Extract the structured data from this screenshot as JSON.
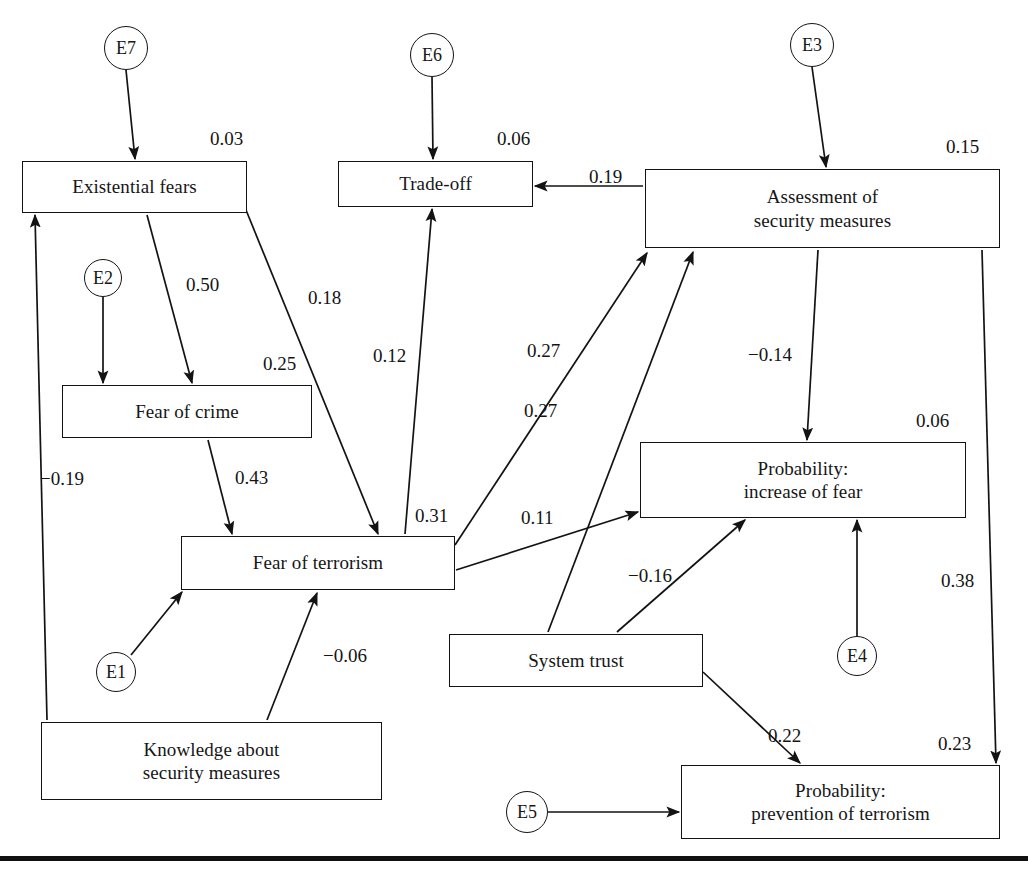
{
  "figure": {
    "type": "path-diagram",
    "title": ""
  },
  "nodes": [
    {
      "id": "existential-fears",
      "label": "Existential fears",
      "lines": [
        "Existential fears"
      ],
      "shape": "rect",
      "x": 22,
      "y": 161,
      "w": 225,
      "h": 52
    },
    {
      "id": "trade-off",
      "label": "Trade-off",
      "lines": [
        "Trade-off"
      ],
      "shape": "rect",
      "x": 338,
      "y": 161,
      "w": 195,
      "h": 46
    },
    {
      "id": "assessment-of-security-measures",
      "label": "Assessment of security measures",
      "lines": [
        "Assessment of",
        "security measures"
      ],
      "shape": "rect",
      "x": 645,
      "y": 169,
      "w": 355,
      "h": 79
    },
    {
      "id": "fear-of-crime",
      "label": "Fear of crime",
      "lines": [
        "Fear of crime"
      ],
      "shape": "rect",
      "x": 62,
      "y": 385,
      "w": 250,
      "h": 53
    },
    {
      "id": "probability-increase-of-fear",
      "label": "Probability: increase of fear",
      "lines": [
        "Probability:",
        "increase of fear"
      ],
      "shape": "rect",
      "x": 640,
      "y": 442,
      "w": 326,
      "h": 76
    },
    {
      "id": "fear-of-terrorism",
      "label": "Fear of terrorism",
      "lines": [
        "Fear of terrorism"
      ],
      "shape": "rect",
      "x": 181,
      "y": 536,
      "w": 274,
      "h": 54
    },
    {
      "id": "system-trust",
      "label": "System trust",
      "lines": [
        "System trust"
      ],
      "shape": "rect",
      "x": 449,
      "y": 634,
      "w": 254,
      "h": 53
    },
    {
      "id": "knowledge-about-security-measures",
      "label": "Knowledge about security measures",
      "lines": [
        "Knowledge about",
        "security measures"
      ],
      "shape": "rect",
      "x": 41,
      "y": 722,
      "w": 341,
      "h": 78
    },
    {
      "id": "probability-prevention-of-terrorism",
      "label": "Probability: prevention of terrorism",
      "lines": [
        "Probability:",
        "prevention of terrorism"
      ],
      "shape": "rect",
      "x": 681,
      "y": 765,
      "w": 319,
      "h": 74
    }
  ],
  "error_terms": [
    {
      "id": "E7",
      "label": "E7",
      "cx": 126,
      "cy": 48,
      "r": 22
    },
    {
      "id": "E6",
      "label": "E6",
      "cx": 432,
      "cy": 55,
      "r": 22
    },
    {
      "id": "E3",
      "label": "E3",
      "cx": 812,
      "cy": 45,
      "r": 22
    },
    {
      "id": "E2",
      "label": "E2",
      "cx": 103,
      "cy": 278,
      "r": 19
    },
    {
      "id": "E1",
      "label": "E1",
      "cx": 116,
      "cy": 672,
      "r": 20
    },
    {
      "id": "E4",
      "label": "E4",
      "cx": 857,
      "cy": 656,
      "r": 20
    },
    {
      "id": "E5",
      "label": "E5",
      "cx": 527,
      "cy": 812,
      "r": 21
    }
  ],
  "explained_variance": [
    {
      "node": "existential-fears",
      "value": "0.03",
      "x": 210,
      "y": 128
    },
    {
      "node": "trade-off",
      "value": "0.06",
      "x": 497,
      "y": 128
    },
    {
      "node": "assessment-of-security-measures",
      "value": "0.15",
      "x": 946,
      "y": 136
    },
    {
      "node": "fear-of-crime",
      "value": "0.25",
      "x": 263,
      "y": 353
    },
    {
      "node": "probability-increase-of-fear",
      "value": "0.06",
      "x": 916,
      "y": 410
    },
    {
      "node": "fear-of-terrorism",
      "value": "0.31",
      "x": 415,
      "y": 505
    },
    {
      "node": "probability-prevention-of-terrorism",
      "value": "0.23",
      "x": 938,
      "y": 733
    }
  ],
  "paths": [
    {
      "id": "e7-to-existential-fears",
      "from": "E7",
      "to": "existential-fears",
      "coefficient": "",
      "x1": 126,
      "y1": 70,
      "x2": 135,
      "y2": 159
    },
    {
      "id": "e6-to-trade-off",
      "from": "E6",
      "to": "trade-off",
      "coefficient": "",
      "x1": 432,
      "y1": 77,
      "x2": 433,
      "y2": 159
    },
    {
      "id": "e3-to-assessment",
      "from": "E3",
      "to": "assessment-of-security-measures",
      "coefficient": "",
      "x1": 812,
      "y1": 67,
      "x2": 826,
      "y2": 167
    },
    {
      "id": "e2-to-fear-of-crime",
      "from": "E2",
      "to": "fear-of-crime",
      "coefficient": "",
      "x1": 103,
      "y1": 297,
      "x2": 103,
      "y2": 383
    },
    {
      "id": "e1-to-fear-of-terrorism",
      "from": "E1",
      "to": "fear-of-terrorism",
      "coefficient": "",
      "x1": 131,
      "y1": 655,
      "x2": 182,
      "y2": 592
    },
    {
      "id": "e4-to-probability-increase",
      "from": "E4",
      "to": "probability-increase-of-fear",
      "coefficient": "",
      "x1": 857,
      "y1": 636,
      "x2": 857,
      "y2": 520
    },
    {
      "id": "e5-to-probability-prevention",
      "from": "E5",
      "to": "probability-prevention-of-terrorism",
      "coefficient": "",
      "x1": 548,
      "y1": 812,
      "x2": 679,
      "y2": 812
    },
    {
      "id": "existential-fears-to-fear-of-crime",
      "from": "existential-fears",
      "to": "fear-of-crime",
      "coefficient": "0.50",
      "label_x": 186,
      "label_y": 274,
      "x1": 147,
      "y1": 215,
      "x2": 192,
      "y2": 383
    },
    {
      "id": "existential-fears-to-fear-of-terrorism",
      "from": "existential-fears",
      "to": "fear-of-terrorism",
      "coefficient": "0.18",
      "label_x": 308,
      "label_y": 287,
      "x1": 246,
      "y1": 210,
      "x2": 378,
      "y2": 534
    },
    {
      "id": "fear-of-crime-to-fear-of-terrorism",
      "from": "fear-of-crime",
      "to": "fear-of-terrorism",
      "coefficient": "0.43",
      "label_x": 235,
      "label_y": 467,
      "x1": 208,
      "y1": 440,
      "x2": 232,
      "y2": 534
    },
    {
      "id": "knowledge-to-existential-fears",
      "from": "knowledge-about-security-measures",
      "to": "existential-fears",
      "coefficient": "−0.19",
      "label_x": 40,
      "label_y": 468,
      "x1": 47,
      "y1": 720,
      "x2": 35,
      "y2": 215
    },
    {
      "id": "knowledge-to-fear-of-terrorism",
      "from": "knowledge-about-security-measures",
      "to": "fear-of-terrorism",
      "coefficient": "−0.06",
      "label_x": 323,
      "label_y": 645,
      "x1": 267,
      "y1": 720,
      "x2": 317,
      "y2": 593
    },
    {
      "id": "fear-of-terrorism-to-trade-off",
      "from": "fear-of-terrorism",
      "to": "trade-off",
      "coefficient": "0.12",
      "label_x": 373,
      "label_y": 345,
      "x1": 405,
      "y1": 534,
      "x2": 432,
      "y2": 209
    },
    {
      "id": "fear-of-terrorism-to-assessment",
      "from": "fear-of-terrorism",
      "to": "assessment-of-security-measures",
      "coefficient": "0.27",
      "label_x": 527,
      "label_y": 340,
      "x1": 455,
      "y1": 545,
      "x2": 647,
      "y2": 253
    },
    {
      "id": "system-trust-to-assessment",
      "from": "system-trust",
      "to": "assessment-of-security-measures",
      "coefficient": "0.27",
      "label_x": 524,
      "label_y": 400,
      "x1": 548,
      "y1": 632,
      "x2": 693,
      "y2": 252
    },
    {
      "id": "assessment-to-trade-off",
      "from": "assessment-of-security-measures",
      "to": "trade-off",
      "coefficient": "0.19",
      "label_x": 589,
      "label_y": 166,
      "x1": 643,
      "y1": 186,
      "x2": 535,
      "y2": 186
    },
    {
      "id": "assessment-to-probability-increase",
      "from": "assessment-of-security-measures",
      "to": "probability-increase-of-fear",
      "coefficient": "−0.14",
      "label_x": 748,
      "label_y": 344,
      "x1": 818,
      "y1": 250,
      "x2": 807,
      "y2": 440
    },
    {
      "id": "assessment-to-probability-prevention",
      "from": "assessment-of-security-measures",
      "to": "probability-prevention-of-terrorism",
      "coefficient": "0.38",
      "label_x": 941,
      "label_y": 570,
      "x1": 982,
      "y1": 250,
      "x2": 996,
      "y2": 763
    },
    {
      "id": "fear-of-terrorism-to-probability-increase",
      "from": "fear-of-terrorism",
      "to": "probability-increase-of-fear",
      "coefficient": "0.11",
      "label_x": 521,
      "label_y": 507,
      "x1": 456,
      "y1": 570,
      "x2": 638,
      "y2": 512
    },
    {
      "id": "system-trust-to-probability-increase",
      "from": "system-trust",
      "to": "probability-increase-of-fear",
      "coefficient": "−0.16",
      "label_x": 628,
      "label_y": 565,
      "x1": 617,
      "y1": 632,
      "x2": 745,
      "y2": 520
    },
    {
      "id": "system-trust-to-probability-prevention",
      "from": "system-trust",
      "to": "probability-prevention-of-terrorism",
      "coefficient": "0.22",
      "label_x": 768,
      "label_y": 725,
      "x1": 703,
      "y1": 672,
      "x2": 800,
      "y2": 763
    }
  ],
  "style": {
    "line_color": "#131313",
    "text_color": "#161616",
    "background": "#ffffff"
  },
  "bottom_rule": {
    "y": 856,
    "height": 5
  }
}
